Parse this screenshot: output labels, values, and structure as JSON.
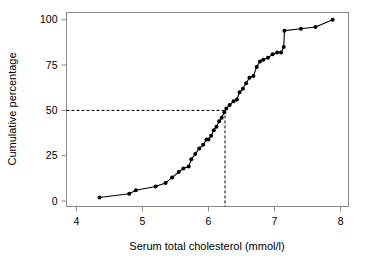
{
  "chart_data": {
    "type": "line",
    "title": "",
    "subtitle": "",
    "xlabel": "Serum total cholesterol (mmol/l)",
    "ylabel": "Cumulative percentage",
    "xlim": [
      3.85,
      8.12
    ],
    "ylim": [
      -3,
      104
    ],
    "xticks": [
      4,
      5,
      6,
      7,
      8
    ],
    "xticklabels": [
      "4",
      "5",
      "6",
      "7",
      "8"
    ],
    "yticks": [
      0,
      25,
      50,
      75,
      100
    ],
    "yticklabels": [
      "0",
      "25",
      "50",
      "75",
      "100"
    ],
    "grid": false,
    "legend": null,
    "marker": "filled-circle",
    "line_color": "#000000",
    "frame_color": "#808080",
    "series": [
      {
        "name": "Cumulative distribution",
        "x": [
          4.35,
          4.8,
          4.9,
          5.2,
          5.35,
          5.45,
          5.55,
          5.62,
          5.7,
          5.74,
          5.8,
          5.86,
          5.92,
          5.97,
          6.0,
          6.04,
          6.08,
          6.12,
          6.16,
          6.2,
          6.24,
          6.27,
          6.32,
          6.38,
          6.43,
          6.47,
          6.52,
          6.57,
          6.62,
          6.68,
          6.73,
          6.78,
          6.83,
          6.9,
          6.97,
          7.04,
          7.1,
          7.14,
          7.15,
          7.4,
          7.62,
          7.88
        ],
        "y": [
          2,
          4,
          6,
          8,
          10,
          13,
          16,
          18,
          19,
          23,
          26,
          29,
          31,
          34,
          34,
          36,
          39,
          41,
          44,
          46,
          49,
          51,
          53,
          55,
          56,
          60,
          62,
          65,
          68,
          69,
          74,
          77,
          78,
          79,
          81,
          82,
          82,
          85,
          94,
          95,
          96,
          100
        ]
      }
    ],
    "annotations": {
      "median_guide": {
        "label": "median reference lines",
        "y_value": 50,
        "x_value": 6.25,
        "style": "dashed",
        "color": "#000000"
      }
    }
  },
  "axes": {
    "x_title": "Serum total cholesterol (mmol/l)",
    "y_title": "Cumulative percentage"
  }
}
